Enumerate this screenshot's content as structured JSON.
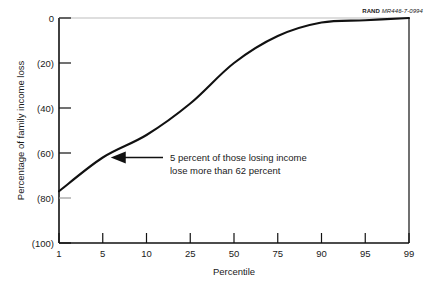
{
  "credit": {
    "brand": "RAND",
    "id": "MR446-7-0994"
  },
  "chart_data": {
    "type": "line",
    "title": "",
    "subtitle": "",
    "xlabel": "Percentile",
    "ylabel": "Percentage of family income loss",
    "x_tick_labels": [
      "1",
      "5",
      "10",
      "25",
      "50",
      "75",
      "90",
      "95",
      "99"
    ],
    "x_tick_values": [
      1,
      5,
      10,
      25,
      50,
      75,
      90,
      95,
      99
    ],
    "x_scale": "probability",
    "y_tick_labels": [
      "0",
      "(20)",
      "(40)",
      "(60)",
      "(80)",
      "(100)"
    ],
    "y_tick_values": [
      0,
      -20,
      -40,
      -60,
      -80,
      -100
    ],
    "ylim": [
      -100,
      0
    ],
    "grid": false,
    "legend": null,
    "series": [
      {
        "name": "Family income loss by percentile",
        "x": [
          1,
          5,
          10,
          25,
          50,
          75,
          90,
          95,
          99
        ],
        "values": [
          -77,
          -62,
          -52,
          -38,
          -20,
          -8,
          -2,
          -1,
          0
        ]
      }
    ],
    "annotations": [
      {
        "name": "five-percent-callout",
        "line1": "5 percent of those losing income",
        "line2": "lose more than 62 percent",
        "points_to_x": 5,
        "points_to_y": -62,
        "arrow": "left"
      }
    ],
    "colors": {
      "line": "#111111",
      "axis": "#111111",
      "text": "#1a1a1a",
      "background": "#ffffff"
    }
  }
}
